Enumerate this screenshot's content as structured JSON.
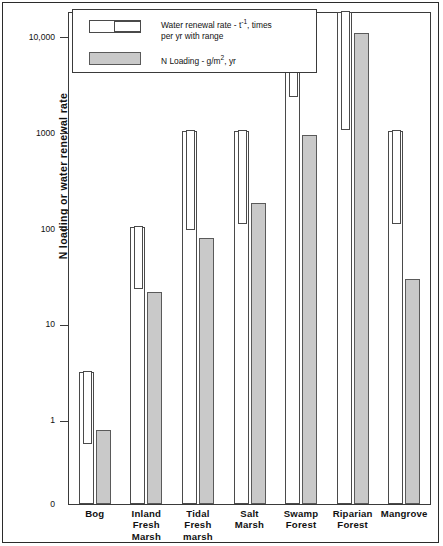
{
  "chart_data": {
    "type": "bar",
    "title": "",
    "xlabel": "",
    "ylabel": "N loading or water renewal rate",
    "scale": "log",
    "ylim": [
      0,
      25000
    ],
    "grid": false,
    "ytick_labels": [
      "10,000",
      "1000",
      "100",
      "10",
      "1",
      "0"
    ],
    "ytick_values": [
      10000,
      1000,
      100,
      10,
      1,
      0
    ],
    "categories": [
      "Bog",
      "Inland Fresh Marsh",
      "Tidal Fresh marsh",
      "Salt Marsh",
      "Swamp Forest",
      "Riparian Forest",
      "Mangrove"
    ],
    "legend_position": "top-left",
    "series": [
      {
        "name": "Water renewal rate - t-1, times per yr with range",
        "style": "white-bar-with-range",
        "values": [
          3.2,
          105,
          1050,
          1050,
          12000,
          25000,
          1050
        ],
        "range_low": [
          0.55,
          23,
          95,
          110,
          2300,
          1050,
          110
        ]
      },
      {
        "name": "N Loading - g/m2, yr",
        "style": "gray-bar",
        "values": [
          0.8,
          22,
          80,
          185,
          950,
          11000,
          30
        ]
      }
    ]
  },
  "axis": {
    "y_label": "N loading or water renewal rate",
    "ticks": [
      {
        "label": "10,000",
        "value": 10000
      },
      {
        "label": "1000",
        "value": 1000
      },
      {
        "label": "100",
        "value": 100
      },
      {
        "label": "10",
        "value": 10
      },
      {
        "label": "1",
        "value": 1
      },
      {
        "label": "0",
        "value": 0
      }
    ]
  },
  "legend": {
    "items": [
      {
        "swatch": "white-range-bar",
        "line1": "Water renewal rate - t",
        "sup": "-1",
        "line1b": ", times",
        "line2": "per yr with range"
      },
      {
        "swatch": "gray-bar",
        "line1": "N Loading - g/m",
        "sup": "2",
        "line1b": ", yr",
        "line2": ""
      }
    ]
  },
  "xaxis": {
    "labels": [
      "Bog",
      "Inland\nFresh\nMarsh",
      "Tidal\nFresh\nmarsh",
      "Salt\nMarsh",
      "Swamp\nForest",
      "Riparian\nForest",
      "Mangrove"
    ]
  },
  "colors": {
    "bar_white_fill": "#ffffff",
    "bar_gray_fill": "#c9c9c9",
    "stroke": "#4a4a4a",
    "frame": "#3a3a3a",
    "text": "#111111"
  }
}
